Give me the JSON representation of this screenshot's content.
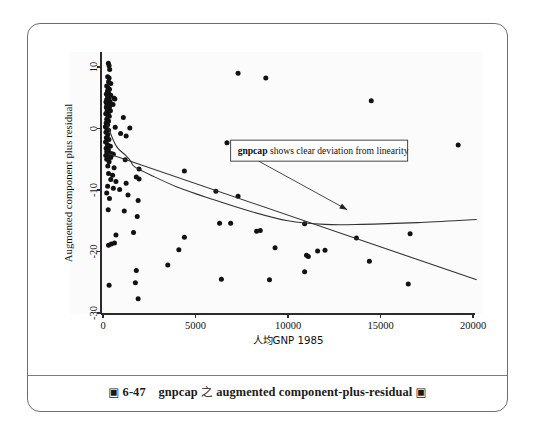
{
  "figure": {
    "caption_prefix_icon": "square-glyph",
    "caption_number": "6-47",
    "caption_zhi": "之",
    "caption_title": "gnpcap",
    "caption_rest": "augmented component-plus-residual",
    "caption_suffix_icon": "square-glyph",
    "caption_full": "圖 6-47   gnpcap 之 augmented component-plus-residual 圖"
  },
  "annotation": {
    "bold_term": "gnpcap",
    "text": " shows clear deviation from linearity",
    "full": "gnpcap shows clear deviation from linearity"
  },
  "chart_data": {
    "type": "scatter",
    "title": "",
    "xlabel": "人均GNP 1985",
    "ylabel": "Augmented component plus residual",
    "xlim": [
      -800,
      20800
    ],
    "ylim": [
      -32,
      12
    ],
    "xticks": [
      0,
      5000,
      10000,
      15000,
      20000
    ],
    "xtick_labels": [
      "0",
      "5000",
      "10000",
      "15000",
      "20000"
    ],
    "yticks": [
      10,
      0,
      -10,
      -20,
      -30
    ],
    "ytick_labels": [
      "10",
      "0",
      "-10",
      "-20",
      "-30"
    ],
    "grid": false,
    "legend": false,
    "marker": "filled-circle",
    "marker_color": "#111111",
    "points": [
      [
        290,
        10.6
      ],
      [
        330,
        10.2
      ],
      [
        360,
        9.6
      ],
      [
        250,
        8.4
      ],
      [
        330,
        8.2
      ],
      [
        300,
        7.6
      ],
      [
        420,
        7.3
      ],
      [
        200,
        6.9
      ],
      [
        280,
        6.6
      ],
      [
        350,
        6.4
      ],
      [
        240,
        6.1
      ],
      [
        300,
        5.8
      ],
      [
        180,
        5.6
      ],
      [
        420,
        5.4
      ],
      [
        250,
        5.2
      ],
      [
        330,
        5.0
      ],
      [
        600,
        4.9
      ],
      [
        640,
        4.8
      ],
      [
        200,
        4.7
      ],
      [
        290,
        4.5
      ],
      [
        380,
        4.4
      ],
      [
        160,
        4.3
      ],
      [
        250,
        4.2
      ],
      [
        330,
        4.1
      ],
      [
        420,
        4.0
      ],
      [
        540,
        3.9
      ],
      [
        210,
        3.8
      ],
      [
        290,
        3.6
      ],
      [
        350,
        3.5
      ],
      [
        180,
        3.4
      ],
      [
        260,
        3.2
      ],
      [
        330,
        3.0
      ],
      [
        400,
        2.9
      ],
      [
        220,
        2.8
      ],
      [
        290,
        2.6
      ],
      [
        150,
        2.4
      ],
      [
        250,
        2.2
      ],
      [
        340,
        2.0
      ],
      [
        1100,
        1.8
      ],
      [
        200,
        1.5
      ],
      [
        300,
        1.2
      ],
      [
        170,
        0.9
      ],
      [
        250,
        0.6
      ],
      [
        130,
        0.3
      ],
      [
        660,
        0.2
      ],
      [
        1450,
        0.1
      ],
      [
        210,
        -0.1
      ],
      [
        300,
        -0.3
      ],
      [
        160,
        -0.6
      ],
      [
        950,
        -0.8
      ],
      [
        260,
        -1.0
      ],
      [
        1250,
        -1.2
      ],
      [
        180,
        -1.5
      ],
      [
        320,
        -1.8
      ],
      [
        140,
        -2.2
      ],
      [
        240,
        -2.6
      ],
      [
        400,
        -2.9
      ],
      [
        170,
        -3.2
      ],
      [
        290,
        -3.5
      ],
      [
        200,
        -3.8
      ],
      [
        350,
        -4.0
      ],
      [
        480,
        -4.1
      ],
      [
        560,
        -4.2
      ],
      [
        150,
        -4.4
      ],
      [
        260,
        -4.5
      ],
      [
        310,
        -4.6
      ],
      [
        420,
        -4.7
      ],
      [
        200,
        -5.0
      ],
      [
        1200,
        -5.1
      ],
      [
        330,
        -5.4
      ],
      [
        260,
        -6.1
      ],
      [
        600,
        -6.4
      ],
      [
        1950,
        -6.6
      ],
      [
        4400,
        -6.9
      ],
      [
        300,
        -7.3
      ],
      [
        520,
        -7.6
      ],
      [
        1800,
        -7.9
      ],
      [
        420,
        -8.3
      ],
      [
        700,
        -8.6
      ],
      [
        1250,
        -8.9
      ],
      [
        1950,
        -8.2
      ],
      [
        250,
        -9.4
      ],
      [
        560,
        -9.7
      ],
      [
        900,
        -9.9
      ],
      [
        6100,
        -10.2
      ],
      [
        200,
        -10.5
      ],
      [
        1350,
        -10.8
      ],
      [
        7300,
        -11.0
      ],
      [
        350,
        -11.4
      ],
      [
        1900,
        -11.7
      ],
      [
        280,
        -13.2
      ],
      [
        1150,
        -13.4
      ],
      [
        1850,
        -14.3
      ],
      [
        3500,
        -22.2
      ],
      [
        6300,
        -15.4
      ],
      [
        6900,
        -15.4
      ],
      [
        10900,
        -15.5
      ],
      [
        16600,
        -17.1
      ],
      [
        13700,
        -17.8
      ],
      [
        8300,
        -16.7
      ],
      [
        8500,
        -16.6
      ],
      [
        700,
        -17.3
      ],
      [
        1650,
        -16.9
      ],
      [
        450,
        -18.8
      ],
      [
        620,
        -18.6
      ],
      [
        300,
        -19.0
      ],
      [
        4400,
        -17.7
      ],
      [
        4100,
        -19.7
      ],
      [
        9300,
        -19.4
      ],
      [
        11000,
        -20.6
      ],
      [
        11100,
        -20.8
      ],
      [
        11600,
        -19.9
      ],
      [
        12000,
        -19.8
      ],
      [
        14400,
        -21.6
      ],
      [
        1800,
        -23.1
      ],
      [
        10900,
        -23.3
      ],
      [
        6400,
        -24.5
      ],
      [
        9000,
        -24.6
      ],
      [
        330,
        -25.5
      ],
      [
        1750,
        -25.1
      ],
      [
        16500,
        -25.3
      ],
      [
        1900,
        -27.7
      ],
      [
        19200,
        -2.7
      ],
      [
        14500,
        4.5
      ],
      [
        7300,
        9.0
      ],
      [
        8800,
        8.2
      ],
      [
        6700,
        -2.3
      ]
    ],
    "lines": [
      {
        "name": "linear-fit",
        "style": "straight",
        "points": [
          [
            300,
            -4.1
          ],
          [
            20200,
            -24.6
          ]
        ]
      },
      {
        "name": "lowess-fit",
        "style": "curved",
        "points": [
          [
            250,
            0.6
          ],
          [
            500,
            -1.5
          ],
          [
            800,
            -3.2
          ],
          [
            1200,
            -4.3
          ],
          [
            1500,
            -5.3
          ],
          [
            1700,
            -6.2
          ],
          [
            2600,
            -7.6
          ],
          [
            4000,
            -9.5
          ],
          [
            6000,
            -11.6
          ],
          [
            8000,
            -13.5
          ],
          [
            10000,
            -15.0
          ],
          [
            12000,
            -15.6
          ],
          [
            14000,
            -15.6
          ],
          [
            17000,
            -15.3
          ],
          [
            20200,
            -14.8
          ]
        ]
      }
    ],
    "annotations": [
      {
        "text": "gnpcap shows clear deviation from linearity",
        "box_x": 6900,
        "box_y": -3.6,
        "arrow_to_x": 13200,
        "arrow_to_y": -13.2
      }
    ]
  }
}
